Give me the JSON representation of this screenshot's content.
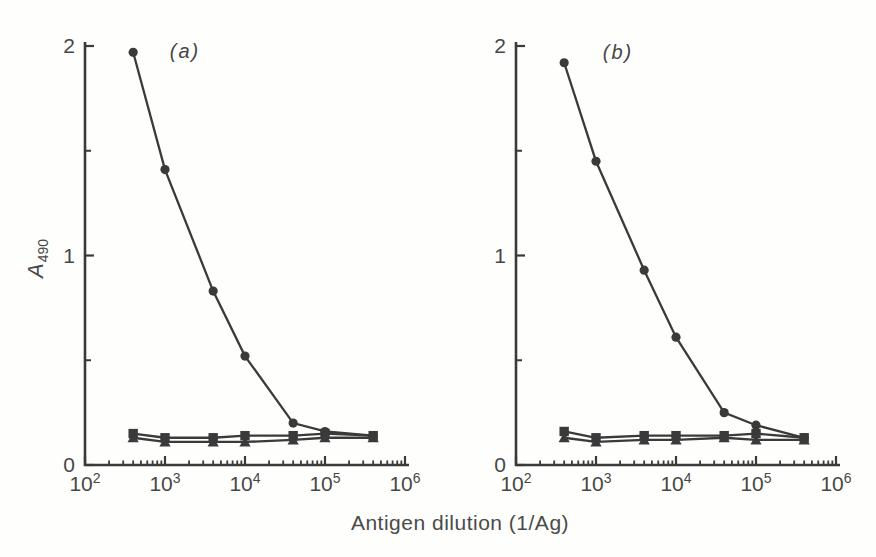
{
  "figure": {
    "xlabel": "Antigen dilution (1/Ag)",
    "ylabel": {
      "base": "A",
      "sub": "490"
    },
    "line_color": "#3a3a3a",
    "text_color": "#474747",
    "background": "#fefefd"
  },
  "chart_data": [
    {
      "type": "line",
      "panel_label": "(a)",
      "x_axis": {
        "scale": "log",
        "min_exp": 2,
        "max_exp": 6,
        "tick_base": "10",
        "tick_exponents": [
          2,
          3,
          4,
          5,
          6
        ]
      },
      "y_axis": {
        "min": 0,
        "max": 2,
        "ticks": [
          0,
          1,
          2
        ],
        "minor_ticks": [
          0.5,
          1.5
        ]
      },
      "series": [
        {
          "name": "immune-serum",
          "marker": "circle",
          "x": [
            400,
            1000,
            4000,
            10000,
            40000,
            100000,
            400000
          ],
          "y": [
            1.97,
            1.41,
            0.83,
            0.52,
            0.2,
            0.16,
            0.14
          ]
        },
        {
          "name": "control-squares",
          "marker": "square",
          "x": [
            400,
            1000,
            4000,
            10000,
            40000,
            100000,
            400000
          ],
          "y": [
            0.15,
            0.13,
            0.13,
            0.14,
            0.14,
            0.15,
            0.14
          ]
        },
        {
          "name": "control-triangles",
          "marker": "triangle",
          "x": [
            400,
            1000,
            4000,
            10000,
            40000,
            100000,
            400000
          ],
          "y": [
            0.13,
            0.11,
            0.11,
            0.11,
            0.12,
            0.13,
            0.13
          ]
        }
      ]
    },
    {
      "type": "line",
      "panel_label": "(b)",
      "x_axis": {
        "scale": "log",
        "min_exp": 2,
        "max_exp": 6,
        "tick_base": "10",
        "tick_exponents": [
          2,
          3,
          4,
          5,
          6
        ]
      },
      "y_axis": {
        "min": 0,
        "max": 2,
        "ticks": [
          0,
          1,
          2
        ],
        "minor_ticks": [
          0.5,
          1.5
        ]
      },
      "series": [
        {
          "name": "immune-serum",
          "marker": "circle",
          "x": [
            400,
            1000,
            4000,
            10000,
            40000,
            100000,
            400000
          ],
          "y": [
            1.92,
            1.45,
            0.93,
            0.61,
            0.25,
            0.19,
            0.13
          ]
        },
        {
          "name": "control-squares",
          "marker": "square",
          "x": [
            400,
            1000,
            4000,
            10000,
            40000,
            100000,
            400000
          ],
          "y": [
            0.16,
            0.13,
            0.14,
            0.14,
            0.14,
            0.15,
            0.13
          ]
        },
        {
          "name": "control-triangles",
          "marker": "triangle",
          "x": [
            400,
            1000,
            4000,
            10000,
            40000,
            100000,
            400000
          ],
          "y": [
            0.13,
            0.11,
            0.12,
            0.12,
            0.13,
            0.12,
            0.12
          ]
        }
      ]
    }
  ]
}
